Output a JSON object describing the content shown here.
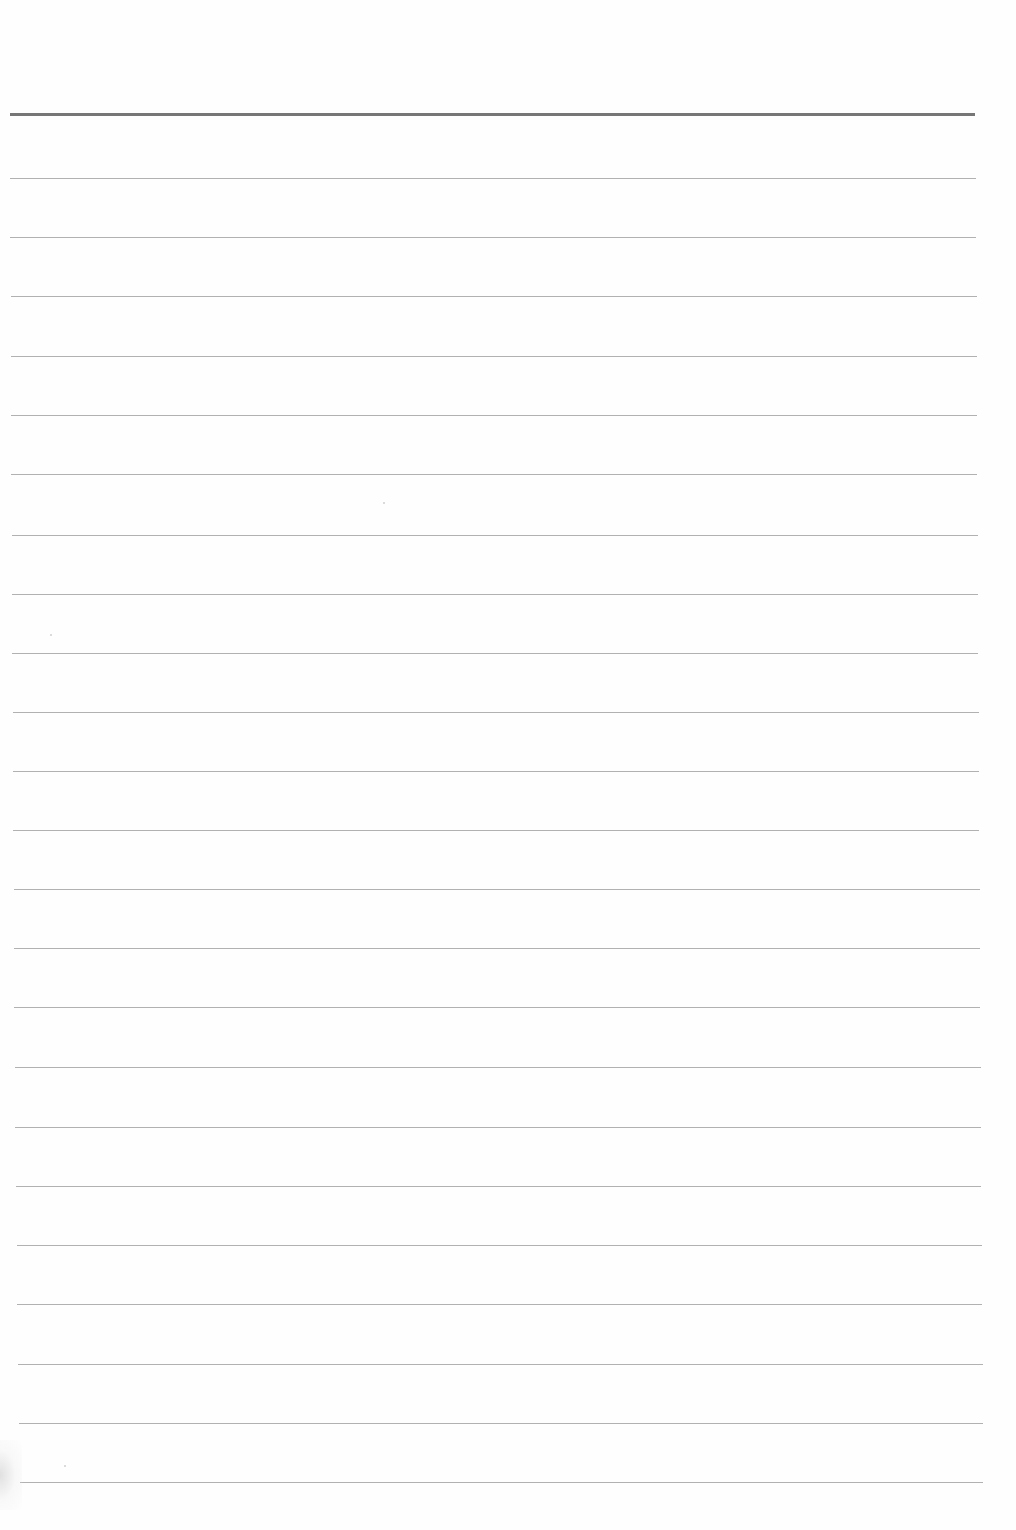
{
  "page": {
    "type": "blank-lined-paper",
    "background": "#fefefe",
    "header_rule": {
      "y": 113,
      "x_start": 10,
      "x_end": 975,
      "thickness": 3,
      "color": "#767676"
    },
    "rule_color": "#a9a9a9",
    "rule_thickness": 1,
    "rules": [
      {
        "y": 178,
        "x_start": 10,
        "x_end": 976
      },
      {
        "y": 237,
        "x_start": 10,
        "x_end": 976
      },
      {
        "y": 296,
        "x_start": 11,
        "x_end": 977
      },
      {
        "y": 356,
        "x_start": 11,
        "x_end": 977
      },
      {
        "y": 415,
        "x_start": 11,
        "x_end": 977
      },
      {
        "y": 474,
        "x_start": 11,
        "x_end": 977
      },
      {
        "y": 535,
        "x_start": 12,
        "x_end": 978
      },
      {
        "y": 594,
        "x_start": 12,
        "x_end": 978
      },
      {
        "y": 653,
        "x_start": 12,
        "x_end": 978
      },
      {
        "y": 712,
        "x_start": 13,
        "x_end": 979
      },
      {
        "y": 771,
        "x_start": 13,
        "x_end": 979
      },
      {
        "y": 830,
        "x_start": 13,
        "x_end": 979
      },
      {
        "y": 889,
        "x_start": 14,
        "x_end": 980
      },
      {
        "y": 948,
        "x_start": 14,
        "x_end": 980
      },
      {
        "y": 1007,
        "x_start": 14,
        "x_end": 980
      },
      {
        "y": 1067,
        "x_start": 15,
        "x_end": 981
      },
      {
        "y": 1127,
        "x_start": 15,
        "x_end": 981
      },
      {
        "y": 1186,
        "x_start": 16,
        "x_end": 981
      },
      {
        "y": 1245,
        "x_start": 17,
        "x_end": 982
      },
      {
        "y": 1304,
        "x_start": 17,
        "x_end": 982
      },
      {
        "y": 1364,
        "x_start": 18,
        "x_end": 983
      },
      {
        "y": 1423,
        "x_start": 19,
        "x_end": 983
      },
      {
        "y": 1482,
        "x_start": 20,
        "x_end": 983
      }
    ],
    "specks": [
      {
        "x": 383,
        "y": 502
      },
      {
        "x": 50,
        "y": 634
      },
      {
        "x": 64,
        "y": 1465
      }
    ]
  }
}
